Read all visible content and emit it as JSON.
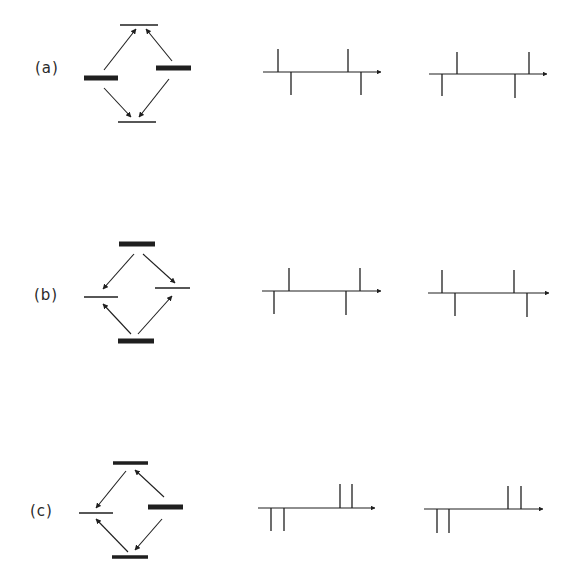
{
  "figure": {
    "background": "#ffffff",
    "ink_color": "#1f1f1f",
    "rows": [
      {
        "label": "(a)",
        "label_pos": [
          35,
          59
        ],
        "level_diagram": {
          "levels": [
            {
              "name": "top",
              "kind": "thin",
              "x1": 120,
              "x2": 158,
              "y": 25
            },
            {
              "name": "left",
              "kind": "thick",
              "x1": 84,
              "x2": 118,
              "y": 78
            },
            {
              "name": "right",
              "kind": "thick",
              "x1": 156,
              "x2": 191,
              "y": 68
            },
            {
              "name": "bottom",
              "kind": "thin",
              "x1": 118,
              "x2": 156,
              "y": 122
            }
          ],
          "arrows": [
            {
              "from": [
                104,
                70
              ],
              "to": [
                136,
                29
              ]
            },
            {
              "from": [
                172,
                61
              ],
              "to": [
                146,
                29
              ]
            },
            {
              "from": [
                104,
                88
              ],
              "to": [
                131,
                117
              ]
            },
            {
              "from": [
                169,
                79
              ],
              "to": [
                139,
                117
              ]
            }
          ]
        },
        "spectra": [
          {
            "axis_y": 72,
            "x_start": 263,
            "x_end": 381,
            "lines": [
              {
                "x": 278,
                "dir": "up",
                "len": 23
              },
              {
                "x": 291,
                "dir": "down",
                "len": 23
              },
              {
                "x": 348,
                "dir": "up",
                "len": 23
              },
              {
                "x": 361,
                "dir": "down",
                "len": 23
              }
            ]
          },
          {
            "axis_y": 74,
            "x_start": 429,
            "x_end": 547,
            "lines": [
              {
                "x": 442,
                "dir": "down",
                "len": 22
              },
              {
                "x": 457,
                "dir": "up",
                "len": 22
              },
              {
                "x": 515,
                "dir": "down",
                "len": 24
              },
              {
                "x": 529,
                "dir": "up",
                "len": 22
              }
            ]
          }
        ]
      },
      {
        "label": "(b)",
        "label_pos": [
          34,
          286
        ],
        "level_diagram": {
          "levels": [
            {
              "name": "top",
              "kind": "thick",
              "x1": 119,
              "x2": 155,
              "y": 244
            },
            {
              "name": "left",
              "kind": "thin",
              "x1": 84,
              "x2": 118,
              "y": 297
            },
            {
              "name": "right",
              "kind": "thin",
              "x1": 155,
              "x2": 190,
              "y": 288
            },
            {
              "name": "bottom",
              "kind": "thick",
              "x1": 118,
              "x2": 154,
              "y": 341
            }
          ],
          "arrows": [
            {
              "from": [
                134,
                254
              ],
              "to": [
                103,
                289
              ]
            },
            {
              "from": [
                143,
                254
              ],
              "to": [
                175,
                283
              ]
            },
            {
              "from": [
                131,
                334
              ],
              "to": [
                103,
                304
              ]
            },
            {
              "from": [
                138,
                334
              ],
              "to": [
                172,
                296
              ]
            }
          ]
        },
        "spectra": [
          {
            "axis_y": 291,
            "x_start": 262,
            "x_end": 381,
            "lines": [
              {
                "x": 274,
                "dir": "down",
                "len": 23
              },
              {
                "x": 289,
                "dir": "up",
                "len": 23
              },
              {
                "x": 346,
                "dir": "down",
                "len": 24
              },
              {
                "x": 360,
                "dir": "up",
                "len": 23
              }
            ]
          },
          {
            "axis_y": 293,
            "x_start": 428,
            "x_end": 549,
            "lines": [
              {
                "x": 442,
                "dir": "up",
                "len": 23
              },
              {
                "x": 455,
                "dir": "down",
                "len": 23
              },
              {
                "x": 514,
                "dir": "up",
                "len": 23
              },
              {
                "x": 527,
                "dir": "down",
                "len": 24
              }
            ]
          }
        ]
      },
      {
        "label": "(c)",
        "label_pos": [
          30,
          502
        ],
        "level_diagram": {
          "levels": [
            {
              "name": "top",
              "kind": "medium",
              "x1": 113,
              "x2": 148,
              "y": 463
            },
            {
              "name": "left",
              "kind": "thin",
              "x1": 79,
              "x2": 113,
              "y": 513
            },
            {
              "name": "right",
              "kind": "thick",
              "x1": 148,
              "x2": 183,
              "y": 507
            },
            {
              "name": "bottom",
              "kind": "medium",
              "x1": 112,
              "x2": 148,
              "y": 557
            }
          ],
          "arrows": [
            {
              "from": [
                126,
                471
              ],
              "to": [
                96,
                508
              ]
            },
            {
              "from": [
                164,
                497
              ],
              "to": [
                135,
                470
              ]
            },
            {
              "from": [
                162,
                519
              ],
              "to": [
                135,
                550
              ]
            },
            {
              "from": [
                128,
                552
              ],
              "to": [
                96,
                519
              ]
            }
          ]
        },
        "spectra": [
          {
            "axis_y": 508,
            "x_start": 258,
            "x_end": 375,
            "lines": [
              {
                "x": 271,
                "dir": "down",
                "len": 23
              },
              {
                "x": 284,
                "dir": "down",
                "len": 23
              },
              {
                "x": 340,
                "dir": "up",
                "len": 24
              },
              {
                "x": 352,
                "dir": "up",
                "len": 24
              }
            ]
          },
          {
            "axis_y": 509,
            "x_start": 424,
            "x_end": 543,
            "lines": [
              {
                "x": 437,
                "dir": "down",
                "len": 24
              },
              {
                "x": 449,
                "dir": "down",
                "len": 24
              },
              {
                "x": 508,
                "dir": "up",
                "len": 23
              },
              {
                "x": 521,
                "dir": "up",
                "len": 23
              }
            ]
          }
        ]
      }
    ]
  }
}
